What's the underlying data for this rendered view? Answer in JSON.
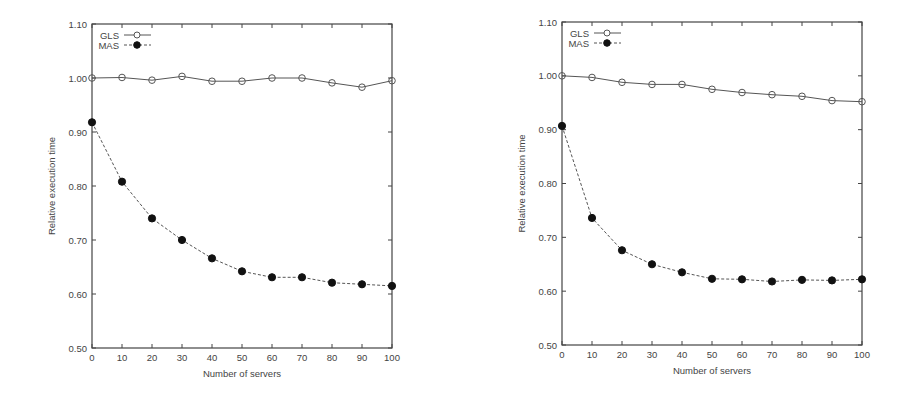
{
  "chart_data": [
    {
      "type": "line",
      "title": "",
      "xlabel": "Number of servers",
      "ylabel": "Relative execution time",
      "x": [
        0,
        10,
        20,
        30,
        40,
        50,
        60,
        70,
        80,
        90,
        100
      ],
      "xlim": [
        0,
        100
      ],
      "ylim": [
        0.5,
        1.1
      ],
      "xticks": [
        "0",
        "10",
        "20",
        "30",
        "40",
        "50",
        "60",
        "70",
        "80",
        "90",
        "100"
      ],
      "yticks": [
        "0.50",
        "0.60",
        "0.70",
        "0.80",
        "0.90",
        "1.00",
        "1.10"
      ],
      "grid": false,
      "legend_position": "top-left",
      "series": [
        {
          "name": "GLS",
          "marker": "open-circle",
          "line": "solid",
          "values": [
            1.0,
            1.001,
            0.996,
            1.003,
            0.994,
            0.994,
            1.0,
            1.0,
            0.991,
            0.983,
            0.995
          ]
        },
        {
          "name": "MAS",
          "marker": "filled-circle",
          "line": "dashed",
          "values": [
            0.918,
            0.808,
            0.74,
            0.7,
            0.666,
            0.642,
            0.631,
            0.631,
            0.621,
            0.618,
            0.615
          ]
        }
      ]
    },
    {
      "type": "line",
      "title": "",
      "xlabel": "Number of servers",
      "ylabel": "Relative execution time",
      "x": [
        0,
        10,
        20,
        30,
        40,
        50,
        60,
        70,
        80,
        90,
        100
      ],
      "xlim": [
        0,
        100
      ],
      "ylim": [
        0.5,
        1.1
      ],
      "xticks": [
        "0",
        "10",
        "20",
        "30",
        "40",
        "50",
        "60",
        "70",
        "80",
        "90",
        "100"
      ],
      "yticks": [
        "0.50",
        "0.60",
        "0.70",
        "0.80",
        "0.90",
        "1.00",
        "1.10"
      ],
      "grid": false,
      "legend_position": "top-left",
      "series": [
        {
          "name": "GLS",
          "marker": "open-circle",
          "line": "solid",
          "values": [
            1.0,
            0.997,
            0.988,
            0.984,
            0.984,
            0.975,
            0.969,
            0.965,
            0.962,
            0.954,
            0.952
          ]
        },
        {
          "name": "MAS",
          "marker": "filled-circle",
          "line": "dashed",
          "values": [
            0.907,
            0.736,
            0.676,
            0.65,
            0.635,
            0.623,
            0.622,
            0.618,
            0.621,
            0.62,
            0.622
          ]
        }
      ]
    }
  ],
  "charts": [
    {
      "xlabel": "Number of servers",
      "ylabel": "Relative execution time",
      "legend": [
        "GLS",
        "MAS"
      ]
    },
    {
      "xlabel": "Number of servers",
      "ylabel": "Relative execution time",
      "legend": [
        "GLS",
        "MAS"
      ]
    }
  ],
  "colors": {
    "line": "#555555",
    "marker_fill": "#111111",
    "axis": "#444444"
  }
}
